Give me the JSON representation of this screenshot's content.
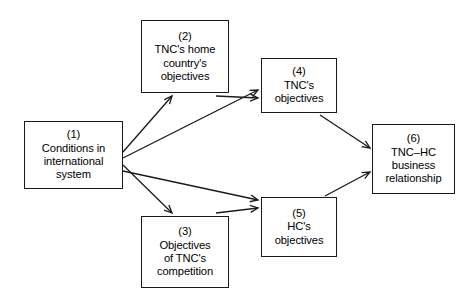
{
  "diagram": {
    "style": {
      "background": "#ffffff",
      "box_border_color": "#1a1a1a",
      "arrow_color": "#1a1a1a",
      "text_color": "#000000"
    },
    "nodes": [
      {
        "id": "1",
        "number": "(1)",
        "lines": [
          "Conditions in",
          "international",
          "system"
        ],
        "x": 24,
        "y": 121,
        "w": 99,
        "h": 68
      },
      {
        "id": "2",
        "number": "(2)",
        "lines": [
          "TNC's home",
          "country's",
          "objectives"
        ],
        "x": 141,
        "y": 20,
        "w": 88,
        "h": 73
      },
      {
        "id": "3",
        "number": "(3)",
        "lines": [
          "Objectives",
          "of TNC's",
          "competition"
        ],
        "x": 141,
        "y": 216,
        "w": 88,
        "h": 72
      },
      {
        "id": "4",
        "number": "(4)",
        "lines": [
          "TNC's",
          "objectives"
        ],
        "x": 261,
        "y": 58,
        "w": 76,
        "h": 55
      },
      {
        "id": "5",
        "number": "(5)",
        "lines": [
          "HC's",
          "objectives"
        ],
        "x": 261,
        "y": 197,
        "w": 76,
        "h": 60
      },
      {
        "id": "6",
        "number": "(6)",
        "lines": [
          "TNC–HC",
          "business",
          "relationship"
        ],
        "x": 372,
        "y": 124,
        "w": 83,
        "h": 70
      }
    ],
    "edges": [
      {
        "from": "1",
        "to": "2",
        "label": ""
      },
      {
        "from": "1",
        "to": "3",
        "label": ""
      },
      {
        "from": "1",
        "to": "4",
        "label": ""
      },
      {
        "from": "1",
        "to": "5",
        "label": ""
      },
      {
        "from": "2",
        "to": "4",
        "label": ""
      },
      {
        "from": "3",
        "to": "5",
        "label": ""
      },
      {
        "from": "4",
        "to": "6",
        "label": ""
      },
      {
        "from": "5",
        "to": "6",
        "label": ""
      }
    ]
  }
}
